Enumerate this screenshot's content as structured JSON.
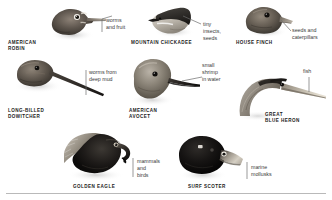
{
  "figure": {
    "palette": {
      "background": "#ffffff",
      "text_dark": "#1b1b1b",
      "text_gray": "#3a3a3a",
      "leader_line": "#6d6d6d",
      "rule": "#b9b9b9",
      "bird_dark": "#2b2b2b",
      "bird_mid": "#7a7a7a",
      "bird_light": "#cfcfcf"
    },
    "birds": [
      {
        "id": "american-robin",
        "name": "AMERICAN\nROBIN",
        "diet": "worms\nand fruit",
        "bill_type": "slender straight probing bill"
      },
      {
        "id": "mountain-chickadee",
        "name": "MOUNTAIN CHICKADEE",
        "diet": "tiny\ninsects,\nseeds",
        "bill_type": "small pointed bill"
      },
      {
        "id": "house-finch",
        "name": "HOUSE FINCH",
        "diet": "seeds and\ncaterpillars",
        "bill_type": "short conical seed-cracking bill"
      },
      {
        "id": "long-billed-dowitcher",
        "name": "LONG-BILLED\nDOWITCHER",
        "diet": "worms from\ndeep mud",
        "bill_type": "very long straight probing bill"
      },
      {
        "id": "american-avocet",
        "name": "AMERICAN\nAVOCET",
        "diet": "small\nshrimp\nin water",
        "bill_type": "long upturned sweeping bill"
      },
      {
        "id": "great-blue-heron",
        "name": "GREAT\nBLUE HERON",
        "diet": "fish",
        "bill_type": "long dagger spearing bill"
      },
      {
        "id": "golden-eagle",
        "name": "GOLDEN EAGLE",
        "diet": "mammals\nand\nbirds",
        "bill_type": "hooked tearing bill"
      },
      {
        "id": "surf-scoter",
        "name": "SURF SCOTER",
        "diet": "marine\nmollusks",
        "bill_type": "heavy broad shellfish bill"
      }
    ]
  }
}
